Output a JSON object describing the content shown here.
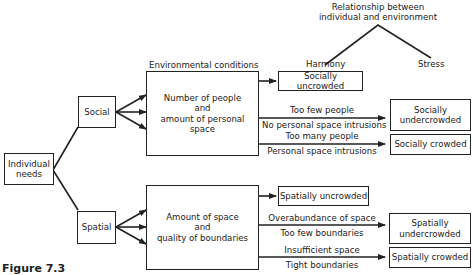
{
  "header": {
    "relationship_title_line1": "Relationship between",
    "relationship_title_line2": "individual and environment",
    "harmony": "Harmony",
    "stress": "Stress",
    "environmental_conditions": "Environmental conditions"
  },
  "nodes": {
    "individual_needs_line1": "Individual",
    "individual_needs_line2": "needs",
    "social": "Social",
    "spatial": "Spatial",
    "social_condition_line1": "Number of people",
    "social_condition_line2": "and",
    "social_condition_line3": "amount of personal space",
    "spatial_condition_line1": "Amount of space",
    "spatial_condition_line2": "and",
    "spatial_condition_line3": "quality of boundaries"
  },
  "outcomes": {
    "socially_uncrowded": "Socially uncrowded",
    "socially_undercrowded_line1": "Socially",
    "socially_undercrowded_line2": "undercrowded",
    "socially_crowded": "Socially crowded",
    "spatially_uncrowded": "Spatially uncrowded",
    "spatially_undercrowded_line1": "Spatially",
    "spatially_undercrowded_line2": "undercrowded",
    "spatially_crowded": "Spatially crowded"
  },
  "edge_labels": {
    "too_few_people": "Too few people",
    "no_personal_space_intrusions": "No personal space intrusions",
    "too_many_people": "Too many people",
    "personal_space_intrusions": "Personal space intrusions",
    "overabundance_of_space": "Overabundance of space",
    "too_few_boundaries": "Too few boundaries",
    "insufficient_space": "Insufficient space",
    "tight_boundaries": "Tight boundaries"
  },
  "caption": "Figure 7.3"
}
